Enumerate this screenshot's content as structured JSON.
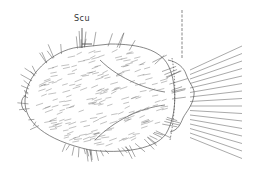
{
  "figure": {
    "labels": [
      {
        "text": "Scu",
        "x": 74,
        "y": 14
      }
    ],
    "colors": {
      "line": "#444444",
      "background": "#ffffff"
    }
  }
}
